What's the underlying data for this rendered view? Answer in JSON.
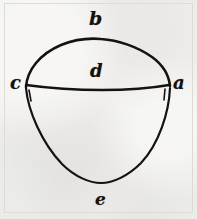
{
  "figure": {
    "kind": "hand-drawn-geometric-diagram",
    "ink_color": "#15130f",
    "paper_color": "#f0efed",
    "frame_color": "#dcdbd8",
    "labels": [
      {
        "id": "b",
        "text": "b",
        "role": "top-apex-label",
        "x": 100,
        "y": 20
      },
      {
        "id": "c",
        "text": "c",
        "role": "left-vertex-label",
        "x": 17,
        "y": 85
      },
      {
        "id": "d",
        "text": "d",
        "role": "chord-center-label",
        "x": 97,
        "y": 71
      },
      {
        "id": "a",
        "text": "a",
        "role": "right-vertex-label",
        "x": 180,
        "y": 85
      },
      {
        "id": "e",
        "text": "e",
        "role": "bottom-apex-label",
        "x": 101,
        "y": 199
      }
    ],
    "strokes": [
      {
        "id": "upper-cap-arc",
        "role": "dome arc from c over b to a"
      },
      {
        "id": "chord-line",
        "role": "horizontal chord from c through d to a"
      },
      {
        "id": "lower-lobe-arc",
        "role": "pointed lobe from c down to e up to a"
      }
    ]
  }
}
